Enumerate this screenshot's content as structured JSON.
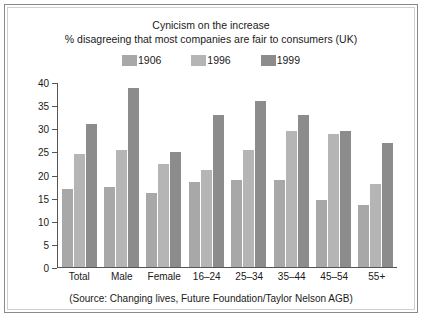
{
  "chart_data": {
    "type": "bar",
    "title": "Cynicism on the increase",
    "subtitle": "% disagreeing that most companies are fair to consumers (UK)",
    "source_note": "(Source: Changing lives, Future Foundation/Taylor Nelson AGB)",
    "xlabel": "",
    "ylabel": "",
    "ylim": [
      0,
      40
    ],
    "yticks": [
      0,
      5,
      10,
      15,
      20,
      25,
      30,
      35,
      40
    ],
    "grid": false,
    "legend_position": "top-center",
    "categories": [
      "Total",
      "Male",
      "Female",
      "16–24",
      "25–34",
      "35–44",
      "45–54",
      "55+"
    ],
    "series": [
      {
        "name": "1906",
        "color": "#a8a8a8",
        "values": [
          17,
          17.5,
          16,
          18.5,
          19,
          19,
          14.5,
          13.5
        ]
      },
      {
        "name": "1996",
        "color": "#b5b5b5",
        "values": [
          24.5,
          25.5,
          22.5,
          21,
          25.5,
          29.5,
          29,
          18
        ]
      },
      {
        "name": "1999",
        "color": "#8c8c8c",
        "values": [
          31,
          39,
          25,
          33,
          36,
          33,
          29.5,
          27
        ]
      }
    ]
  },
  "colors": {
    "frame_border": "#8a8a8a",
    "inner_border": "#cfcfcf",
    "axis": "#555555",
    "text": "#1a1a1a",
    "background": "#ffffff"
  }
}
